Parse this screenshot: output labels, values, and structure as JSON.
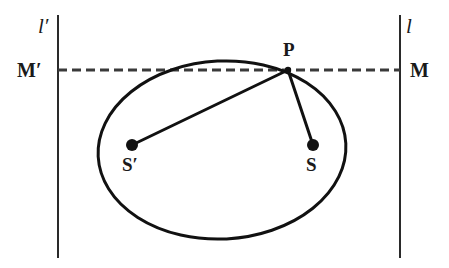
{
  "figure": {
    "kind": "ellipse-foci-directrix-diagram",
    "background_color": "#ffffff",
    "stroke_color": "#1a1a1a",
    "width": 449,
    "height": 268,
    "labels": {
      "directrix_left": "l′",
      "directrix_right": "l",
      "foot_left": "M′",
      "foot_right": "M",
      "point_on_curve": "P",
      "focus_left": "S′",
      "focus_right": "S"
    },
    "elements": {
      "left_vertical_line": {
        "name": "directrix-left-line",
        "x": 58,
        "y_top": 15,
        "y_bottom": 258,
        "style": "solid",
        "width_px": 2
      },
      "right_vertical_line": {
        "name": "directrix-right-line",
        "x": 400,
        "y_top": 15,
        "y_bottom": 258,
        "style": "solid",
        "width_px": 2
      },
      "horizontal_dashed_line": {
        "name": "chord-m-prime-to-m",
        "y": 70,
        "x_start": 58,
        "x_end": 400,
        "style": "dashed",
        "dash": "9 5",
        "width_px": 3
      },
      "ellipse": {
        "name": "ellipse-curve",
        "center_x": 222,
        "center_y": 150,
        "radius_x": 124,
        "radius_y": 89,
        "rotation_deg": -3,
        "width_px": 3
      },
      "focus_left_point": {
        "x": 132,
        "y": 145,
        "radius": 6
      },
      "focus_right_point": {
        "x": 313,
        "y": 145,
        "radius": 6
      },
      "curve_point_p": {
        "x": 288,
        "y": 70,
        "radius": 3
      },
      "radius_line_to_s_prime": {
        "x1": 288,
        "y1": 70,
        "x2": 132,
        "y2": 145,
        "width_px": 3
      },
      "radius_line_to_s": {
        "x1": 288,
        "y1": 70,
        "x2": 313,
        "y2": 145,
        "width_px": 3
      }
    }
  }
}
